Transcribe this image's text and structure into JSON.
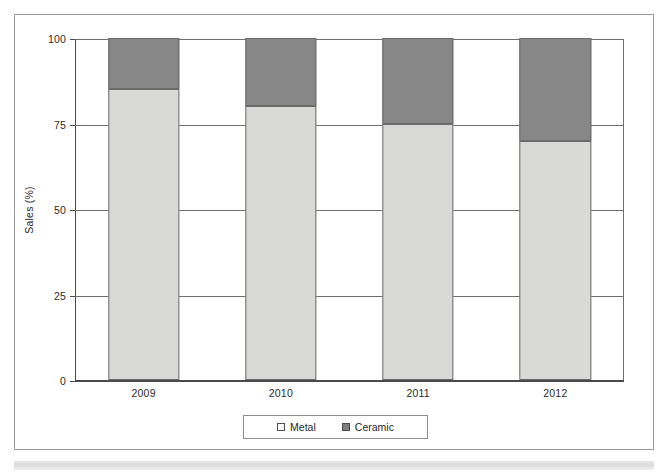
{
  "chart_data": {
    "type": "bar",
    "subtype": "stacked-column-100",
    "title": "",
    "xlabel": "",
    "ylabel": "Sales (%)",
    "categories": [
      "2009",
      "2010",
      "2011",
      "2012"
    ],
    "series": [
      {
        "name": "Metal",
        "values": [
          85,
          80,
          75,
          70
        ],
        "color": "#d9dad7"
      },
      {
        "name": "Ceramic",
        "values": [
          15,
          20,
          25,
          30
        ],
        "color": "#878787"
      }
    ],
    "ylim": [
      0,
      100
    ],
    "yticks": [
      0,
      25,
      50,
      75,
      100
    ],
    "ytick_labels": [
      "0",
      "25",
      "50",
      "75",
      "100"
    ],
    "grid": true,
    "grid_axis": "y",
    "legend": [
      "Metal",
      "Ceramic"
    ],
    "legend_position": "bottom-center"
  },
  "axes": {
    "y_title": "Sales (%)",
    "y_ticks": [
      {
        "label": "100",
        "value": 100
      },
      {
        "label": "75",
        "value": 75
      },
      {
        "label": "50",
        "value": 50
      },
      {
        "label": "25",
        "value": 25
      },
      {
        "label": "0",
        "value": 0
      }
    ],
    "x_ticks": [
      {
        "label": "2009"
      },
      {
        "label": "2010"
      },
      {
        "label": "2011"
      },
      {
        "label": "2012"
      }
    ]
  },
  "legend": {
    "items": [
      {
        "label": "Metal",
        "swatch": "legend-swatch-metal"
      },
      {
        "label": "Ceramic",
        "swatch": "legend-swatch-ceramic"
      }
    ]
  },
  "colors": {
    "metal": "#d9dad7",
    "ceramic": "#878787",
    "axis": "#4a4a4a",
    "grid": "#6e6e6e",
    "frame": "#9a9a9a",
    "text": "#2b2b2b"
  }
}
